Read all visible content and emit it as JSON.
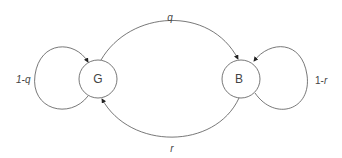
{
  "diagram": {
    "type": "markov-chain",
    "nodes": [
      {
        "id": "G",
        "label": "G"
      },
      {
        "id": "B",
        "label": "B"
      }
    ],
    "edges": [
      {
        "from": "G",
        "to": "B",
        "label": "q"
      },
      {
        "from": "B",
        "to": "G",
        "label": "r"
      },
      {
        "from": "G",
        "to": "G",
        "label": "1-q"
      },
      {
        "from": "B",
        "to": "B",
        "label": "1-r"
      }
    ],
    "colors": {
      "stroke": "#555555",
      "text": "#444444",
      "background": "#ffffff"
    }
  }
}
